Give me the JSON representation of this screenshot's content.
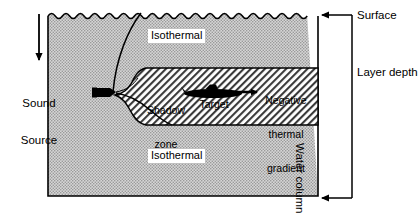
{
  "diagram": {
    "colors": {
      "water_fill": "#c9c9c9",
      "band_fill": "#ffffff",
      "line": "#000000",
      "label_bg": "#ffffff"
    },
    "left_annotation": {
      "arrow": "down-arrow",
      "label_line1": "Sound",
      "label_line2": "Source"
    },
    "water_column": {
      "surface_label": "Surface",
      "upper_layer_label": "Isothermal",
      "lower_layer_label": "Isothermal",
      "shadow_zone_line1": "Shadow",
      "shadow_zone_line2": "zone",
      "target_label": "Target",
      "gradient_line1": "Negative",
      "gradient_line2": "thermal",
      "gradient_line3": "gradient"
    },
    "right_annotation": {
      "surface_label": "Surface",
      "layer_depth_label": "Layer depth",
      "water_column_label": "Water column"
    },
    "icons": {
      "sound_source": "transducer-icon",
      "target": "submarine-icon",
      "ray": "sound-ray-path",
      "heading_arrow": "right-arrow"
    }
  }
}
